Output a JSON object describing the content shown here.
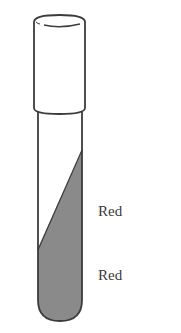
{
  "figure": {
    "type": "test-tube-diagram",
    "labels": [
      {
        "region": "slant",
        "text": "Red"
      },
      {
        "region": "butt",
        "text": "Red"
      }
    ],
    "colors": {
      "outline": "#3c3c3c",
      "medium_fill": "#8a8a8a",
      "background": "#ffffff"
    }
  }
}
